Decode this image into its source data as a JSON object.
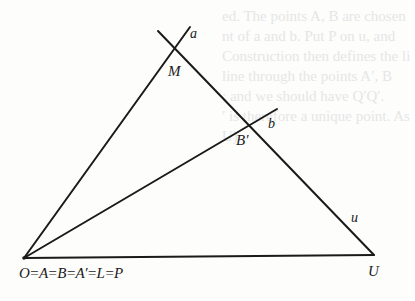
{
  "figure": {
    "type": "geometry-construction",
    "points": {
      "M": {
        "label": "M",
        "x": 175,
        "y": 48
      },
      "B_prime": {
        "label": "B′",
        "x": 249,
        "y": 125
      },
      "U": {
        "label": "U",
        "x": 374,
        "y": 255
      },
      "O": {
        "label": "O=A=B=A′=L=P",
        "x": 24,
        "y": 258
      }
    },
    "lines": {
      "a": {
        "label": "a"
      },
      "b": {
        "label": "b"
      },
      "u": {
        "label": "u"
      }
    },
    "labels": {
      "a": "a",
      "M": "M",
      "b": "b",
      "B_prime": "B′",
      "u": "u",
      "U": "U",
      "origin": "O=A=B=A′=L=P"
    },
    "colors": {
      "ink": "#1a1a1a",
      "paper": "#fdfdfc",
      "bleed": "#e6e6e6"
    }
  },
  "bleed_through_text": [
    "ed. The points A, B are chosen",
    "nt of a and b. Put P on u, and",
    "Construction then defines the li",
    "line through the points A′, B",
    "; and we should have Q′Q′.",
    "′ is therefore a unique point. As",
    "U).",
    "",
    "",
    "",
    "",
    "",
    "",
    "ry therefore contains constructi"
  ]
}
